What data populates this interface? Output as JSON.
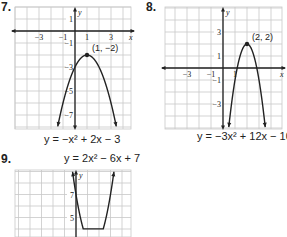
{
  "problems": [
    {
      "number": "7.",
      "equation": "y = −x² + 2x − 3",
      "vertex_label": "(1, −2)"
    },
    {
      "number": "8.",
      "equation": "y = −3x² + 12x − 10",
      "vertex_label": "(2, 2)"
    },
    {
      "number": "9.",
      "equation": "y = 2x² − 6x + 7",
      "vertex_label": ""
    }
  ],
  "colors": {
    "grid": "#c8c8c8",
    "axis": "#222222",
    "curve": "#222222",
    "text": "#222222"
  },
  "chart_data": [
    {
      "type": "line",
      "title": "7. y = −x² + 2x − 3",
      "function": "-x^2 + 2x - 3",
      "vertex": [
        1,
        -2
      ],
      "vertex_label": "(1, −2)",
      "x_ticks": [
        -3,
        -1,
        1,
        3
      ],
      "y_ticks": [
        1,
        -1,
        -3,
        -5,
        -7
      ],
      "xlim": [
        -5,
        4.7
      ],
      "ylim": [
        -8,
        2
      ],
      "xlabel": "x",
      "ylabel": "y",
      "grid": true
    },
    {
      "type": "line",
      "title": "8. y = −3x² + 12x − 10",
      "function": "-3x^2 + 12x - 10",
      "vertex": [
        2,
        2
      ],
      "vertex_label": "(2, 2)",
      "x_ticks": [
        -3,
        -1,
        1
      ],
      "y_ticks": [
        3,
        1,
        -1,
        -3
      ],
      "xlim": [
        -4.8,
        4.9
      ],
      "ylim": [
        -5,
        5
      ],
      "xlabel": "x",
      "ylabel": "y",
      "grid": true
    },
    {
      "type": "line",
      "title": "9. y = 2x² − 6x + 7",
      "function": "2x^2 - 6x + 7",
      "vertex": [
        1.5,
        2.5
      ],
      "y_ticks": [
        7,
        5
      ],
      "xlim": [
        -5,
        4.7
      ],
      "ylim": [
        4,
        9
      ],
      "xlabel": "",
      "ylabel": "y",
      "grid": true
    }
  ]
}
